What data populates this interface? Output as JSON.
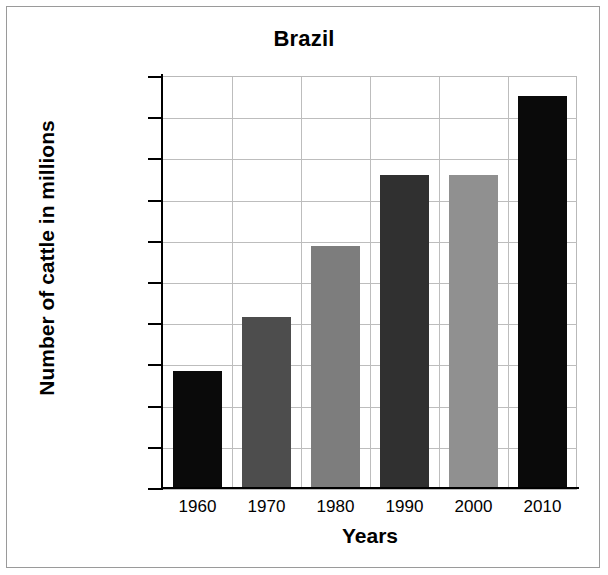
{
  "chart_data": {
    "type": "bar",
    "title": "Brazil",
    "xlabel": "Years",
    "ylabel": "Number of cattle in millions",
    "categories": [
      "1960",
      "1970",
      "1980",
      "1990",
      "2000",
      "2010"
    ],
    "values": [
      57,
      83,
      117.5,
      152,
      152,
      190.5
    ],
    "ylim": [
      0,
      200
    ],
    "yticks": [
      0,
      20,
      40,
      60,
      80,
      100,
      120,
      140,
      160,
      180,
      200
    ],
    "ytick_labels": [
      "0",
      "20",
      "40",
      "60",
      "80",
      "100",
      "120",
      "140",
      "160",
      "180",
      "200"
    ],
    "grid": true,
    "legend": null,
    "bar_colors": [
      "#0a0a0a",
      "#4d4d4d",
      "#7d7d7d",
      "#303030",
      "#909090",
      "#0a0a0a"
    ],
    "series": [
      {
        "name": "Number of cattle in millions",
        "values": [
          57,
          83,
          117.5,
          152,
          152,
          190.5
        ]
      }
    ]
  },
  "figure": {
    "border_color": "#9a9a9a",
    "grid_color": "#bdbdbd",
    "axis_color": "#000000",
    "background": "#ffffff"
  }
}
